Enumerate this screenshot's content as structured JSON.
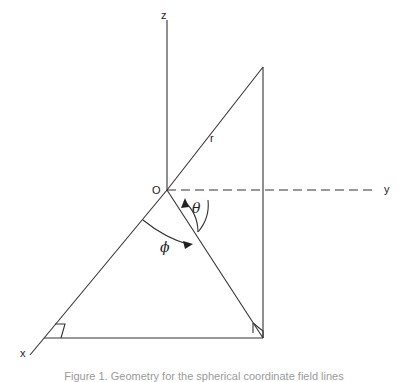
{
  "diagram": {
    "type": "3d-spherical-coordinates",
    "axes": {
      "x_label": "x",
      "y_label": "y",
      "z_label": "z"
    },
    "origin_label": "O",
    "vector_label": "r",
    "angles": {
      "polar": "θ",
      "azimuthal": "ϕ"
    },
    "caption": "Figure 1. Geometry for the spherical coordinate field lines"
  }
}
